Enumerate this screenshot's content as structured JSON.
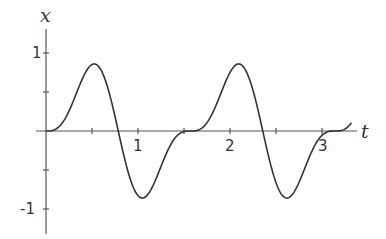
{
  "chart_data": {
    "type": "line",
    "title": "",
    "xlabel": "t",
    "ylabel": "x",
    "xlim": [
      0,
      3.3
    ],
    "ylim": [
      -1.3,
      1.3
    ],
    "grid": false,
    "legend": null,
    "x_ticks": [
      0.5,
      1,
      1.5,
      2,
      2.5,
      3
    ],
    "x_tick_labels": {
      "1": "1",
      "2": "2",
      "3": "3"
    },
    "y_ticks": [
      1,
      0.5,
      -0.5,
      -1
    ],
    "y_tick_labels": {
      "1": "1",
      "-1": "-1"
    },
    "series": [
      {
        "name": "x(t)",
        "x": [
          0,
          0.1,
          0.2,
          0.3,
          0.4,
          0.5,
          0.52,
          0.6,
          0.7,
          0.785,
          0.9,
          1.0,
          1.05,
          1.1,
          1.2,
          1.3,
          1.4,
          1.5,
          1.571,
          1.7,
          1.8,
          1.9,
          2.0,
          2.09,
          2.2,
          2.3,
          2.356,
          2.5,
          2.6,
          2.62,
          2.7,
          2.8,
          2.9,
          3.0,
          3.142,
          3.25,
          3.32
        ],
        "values": [
          0,
          0.02,
          0.15,
          0.42,
          0.73,
          0.86,
          0.86,
          0.79,
          0.45,
          0,
          -0.61,
          -0.85,
          -0.86,
          -0.84,
          -0.64,
          -0.33,
          -0.09,
          -0.01,
          0,
          0.05,
          0.23,
          0.52,
          0.79,
          0.86,
          0.75,
          0.4,
          0,
          -0.73,
          -0.86,
          -0.86,
          -0.76,
          -0.44,
          -0.15,
          -0.02,
          0,
          0.07,
          0.19
        ]
      }
    ],
    "color": "#333333"
  },
  "labels": {
    "y_axis": "x",
    "x_axis": "t",
    "tick_1": "1",
    "tick_2": "2",
    "tick_3": "3",
    "ytick_1": "1",
    "ytick_neg1": "-1"
  }
}
